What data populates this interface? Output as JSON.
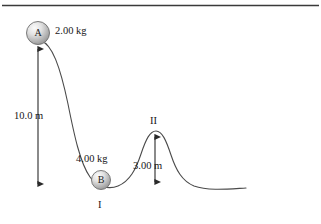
{
  "figure": {
    "type": "physics-track-diagram",
    "frame_line": {
      "present": true,
      "color": "#3a3a3a"
    },
    "track": {
      "color": "#4a4a4a",
      "stroke_width": 1.1
    },
    "balls": [
      {
        "id": "ball-a",
        "letter": "A",
        "mass_label": "2.00 kg",
        "cx": 38,
        "cy": 33,
        "r": 11.5,
        "fill_light": "#f2f2f2",
        "fill_dark": "#9a9a9a",
        "stroke": "#6b6b6b"
      },
      {
        "id": "ball-b",
        "letter": "B",
        "mass_label": "4.00 kg",
        "cx": 101,
        "cy": 180,
        "r": 9.5,
        "fill_light": "#f2f2f2",
        "fill_dark": "#9a9a9a",
        "stroke": "#6b6b6b"
      }
    ],
    "dimensions": [
      {
        "id": "drop-height",
        "label": "10.0 m",
        "x": 38,
        "y_top": 45,
        "y_bottom": 189,
        "label_x": 14,
        "label_y": 111,
        "arrow_color": "#2a2a2a"
      },
      {
        "id": "hill-height",
        "label": "3.00 m",
        "x": 155,
        "y_top": 133,
        "y_bottom": 186,
        "label_x": 133,
        "label_y": 161,
        "arrow_color": "#2a2a2a"
      }
    ],
    "points": [
      {
        "id": "point-i",
        "label": "I",
        "x": 101,
        "y": 206
      },
      {
        "id": "point-ii",
        "label": "II",
        "x": 155,
        "y": 121
      }
    ],
    "colors": {
      "ink": "#1a1a1a",
      "track": "#4a4a4a",
      "arrow": "#2a2a2a",
      "frame": "#3a3a3a",
      "background": "#ffffff"
    }
  }
}
